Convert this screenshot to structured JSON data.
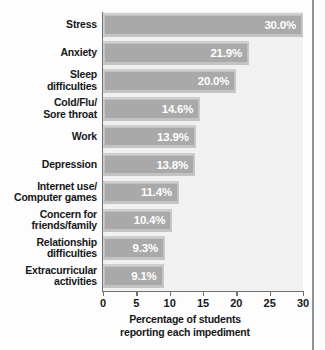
{
  "chart_data": {
    "type": "bar",
    "orientation": "horizontal",
    "title": "",
    "xlabel_line1": "Percentage of students",
    "xlabel_line2": "reporting  each impediment",
    "ylabel": "",
    "xlim": [
      0,
      30
    ],
    "grid": false,
    "legend": null,
    "categories": [
      "Stress",
      "Anxiety",
      "Sleep\ndifficulties",
      "Cold/Flu/\nSore throat",
      "Work",
      "Depression",
      "Internet use/\nComputer games",
      "Concern for\nfriends/family",
      "Relationship\ndifficulties",
      "Extracurricular\nactivities"
    ],
    "values": [
      30.0,
      21.9,
      20.0,
      14.6,
      13.9,
      13.8,
      11.4,
      10.4,
      9.3,
      9.1
    ],
    "value_labels": [
      "30.0%",
      "21.9%",
      "20.0%",
      "14.6%",
      "13.9%",
      "13.8%",
      "11.4%",
      "10.4%",
      "9.3%",
      "9.1%"
    ],
    "xticks": [
      0,
      5,
      10,
      15,
      20,
      25,
      30
    ],
    "xtick_labels": [
      "0",
      "5",
      "10",
      "15",
      "20",
      "25",
      "30"
    ],
    "colors": {
      "bar_fill": "#a9a9a9",
      "bar_highlight": "#cfcfcf",
      "plot_background": "#f1f1f1",
      "axis": "#6e7276",
      "value_text": "#ffffff",
      "label_text": "#16181a"
    }
  }
}
